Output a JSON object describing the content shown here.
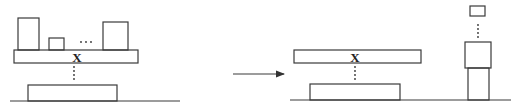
{
  "diagram": {
    "colors": {
      "stroke": "#3a3a3a",
      "background": "#ffffff"
    },
    "before": {
      "plank_label": "X",
      "items_on_plank": [
        "tall-box",
        "small-box",
        "ellipsis",
        "square-box"
      ],
      "ellipsis": "..."
    },
    "after": {
      "plank_label": "X",
      "stack": [
        "small-box",
        "ellipsis",
        "square-box",
        "pillar"
      ]
    },
    "arrow": {
      "direction": "right"
    }
  }
}
